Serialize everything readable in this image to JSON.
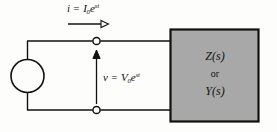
{
  "figure": {
    "name": "ac-circuit-impedance-admittance-diagram",
    "background_color": "#fdfdfc",
    "line_color": "#111111",
    "box_fill_color": "#a8a8a8",
    "box_border_color": "#111111"
  },
  "source": {
    "type": "circle-source",
    "label": ""
  },
  "current": {
    "text_parts": {
      "symbol": "i",
      "equals": " = ",
      "amplitude": "I",
      "amplitude_sub": "0",
      "exp_base": "e",
      "exp_sup": "st"
    },
    "full_text": "i = I0e^st",
    "arrow_direction": "right"
  },
  "voltage": {
    "text_parts": {
      "symbol": "v",
      "equals": " = ",
      "amplitude": "V",
      "amplitude_sub": "0",
      "exp_base": "e",
      "exp_sup": "st"
    },
    "full_text": "v = V0e^st",
    "arrow_direction": "up"
  },
  "network_box": {
    "impedance": "Z(s)",
    "connector": "or",
    "admittance": "Y(s)"
  },
  "terminals": {
    "top": "top-terminal-node",
    "bottom": "bottom-terminal-node"
  }
}
